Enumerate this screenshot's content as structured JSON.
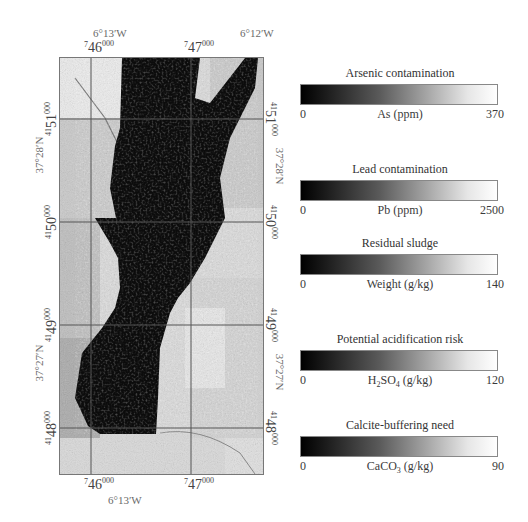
{
  "map": {
    "top_longitude_labels": [
      "6°13′W",
      "6°12′W"
    ],
    "bottom_longitude_labels": [
      "6°13′W"
    ],
    "left_latitude_labels": [
      "37°28′N",
      "37°27′N"
    ],
    "right_latitude_labels": [
      "37°28′N",
      "37°27′N"
    ],
    "easting_ticks": [
      {
        "pre": "7",
        "main": "46",
        "post": "000"
      },
      {
        "pre": "7",
        "main": "47",
        "post": "000"
      }
    ],
    "northing_ticks": [
      {
        "pre": "41",
        "main": "51",
        "post": "000"
      },
      {
        "pre": "41",
        "main": "50",
        "post": "000"
      },
      {
        "pre": "41",
        "main": "49",
        "post": "000"
      },
      {
        "pre": "41",
        "main": "48",
        "post": "000"
      }
    ]
  },
  "legends": [
    {
      "title": "Arsenic contamination",
      "min": "0",
      "unit": "As (ppm)",
      "max": "370"
    },
    {
      "title": "Lead contamination",
      "min": "0",
      "unit": "Pb (ppm)",
      "max": "2500"
    },
    {
      "title": "Residual sludge",
      "min": "0",
      "unit": "Weight (g/kg)",
      "max": "140"
    },
    {
      "title": "Potential acidification risk",
      "min": "0",
      "unit_main": "H",
      "unit_sub1": "2",
      "unit_mid": "SO",
      "unit_sub2": "4",
      "unit_tail": " (g/kg)",
      "max": "120"
    },
    {
      "title": "Calcite-buffering need",
      "min": "0",
      "unit_main": "CaCO",
      "unit_sub1": "3",
      "unit_tail": " (g/kg)",
      "max": "90"
    }
  ],
  "colors": {
    "ramp_low": "#000000",
    "ramp_high": "#ffffff",
    "grid": "#555555",
    "label": "#6a6a6a"
  }
}
